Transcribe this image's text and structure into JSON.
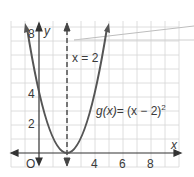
{
  "graph": {
    "function_label": "g(x) = (x − 2)²",
    "function_name": "g(x)",
    "function_expr": "= (x − 2)",
    "exponent": "2",
    "axis_of_symmetry_label": "x = 2",
    "x_axis_label": "x",
    "y_axis_label": "y",
    "origin_label": "O",
    "x_ticks": [
      "4",
      "6",
      "8"
    ],
    "y_ticks": [
      "2",
      "4",
      "8"
    ],
    "colors": {
      "curve": "#555555",
      "grid": "#d8d8d8",
      "axis": "#333333"
    }
  }
}
